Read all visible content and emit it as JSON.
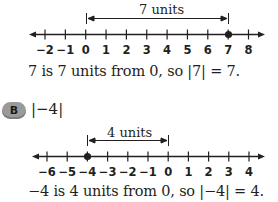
{
  "example_a": {
    "distance_label": "7 units",
    "number_line": {
      "ticks": [
        "−2",
        "−1",
        "0",
        "1",
        "2",
        "3",
        "4",
        "5",
        "6",
        "7",
        "8"
      ],
      "highlighted_point": "7",
      "bracket_from": "0",
      "bracket_to": "7"
    },
    "sentence": "7 is 7 units from 0, so |7| = 7."
  },
  "example_b": {
    "badge": "B",
    "expression": "|−4|",
    "distance_label": "4 units",
    "number_line": {
      "ticks": [
        "−6",
        "−5",
        "−4",
        "−3",
        "−2",
        "−1",
        "0",
        "1",
        "2",
        "3",
        "4"
      ],
      "highlighted_point": "−4",
      "bracket_from": "−4",
      "bracket_to": "0"
    },
    "sentence": "−4 is 4 units from 0, so |−4| = 4."
  },
  "colors": {
    "ink": "#231f20",
    "badge": "#9a9a9a"
  }
}
